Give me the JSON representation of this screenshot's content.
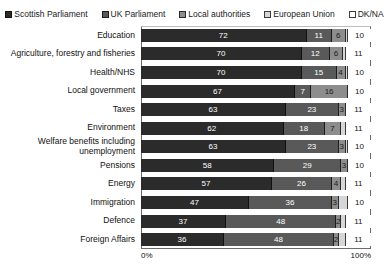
{
  "chart_data": {
    "type": "bar",
    "orientation": "horizontal",
    "stacked": true,
    "normalized_percent": true,
    "title": "",
    "subtitle": "",
    "xlabel": "",
    "ylabel": "",
    "xlim": [
      0,
      100
    ],
    "xticks": [
      "0%",
      "100%"
    ],
    "grid": false,
    "legend_position": "top",
    "categories": [
      "Education",
      "Agriculture, forestry and fisheries",
      "Health/NHS",
      "Local government",
      "Taxes",
      "Environment",
      "Welfare benefits including unemployment",
      "Pensions",
      "Energy",
      "Immigration",
      "Defence",
      "Foreign Affairs"
    ],
    "series": [
      {
        "name": "Scottish Parliament",
        "color": "#2b2b2b",
        "values": [
          72,
          70,
          70,
          67,
          63,
          62,
          63,
          58,
          57,
          47,
          37,
          36
        ]
      },
      {
        "name": "UK Parliament",
        "color": "#595959",
        "values": [
          11,
          12,
          15,
          7,
          23,
          18,
          23,
          29,
          26,
          36,
          48,
          48
        ]
      },
      {
        "name": "Local authorities",
        "color": "#8d8d8d",
        "values": [
          6,
          6,
          4,
          16,
          3,
          7,
          3,
          3,
          4,
          3,
          2,
          2
        ]
      },
      {
        "name": "European Union",
        "color": "#d6d6d6",
        "values": [
          1,
          1,
          1,
          0,
          0,
          2,
          1,
          0,
          2,
          4,
          2,
          3
        ]
      },
      {
        "name": "DK/NA",
        "color": "#ffffff",
        "values": [
          10,
          11,
          10,
          10,
          11,
          11,
          10,
          10,
          11,
          10,
          11,
          11
        ]
      }
    ],
    "data_labels": [
      {
        "category": "Education",
        "labels": [
          "72",
          "11",
          "6",
          "",
          "10"
        ]
      },
      {
        "category": "Agriculture, forestry and fisheries",
        "labels": [
          "70",
          "12",
          "6",
          "",
          "11"
        ]
      },
      {
        "category": "Health/NHS",
        "labels": [
          "70",
          "15",
          "4",
          "",
          "10"
        ]
      },
      {
        "category": "Local government",
        "labels": [
          "67",
          "7",
          "16",
          "",
          "10"
        ]
      },
      {
        "category": "Taxes",
        "labels": [
          "63",
          "23",
          "3",
          "",
          "11"
        ]
      },
      {
        "category": "Environment",
        "labels": [
          "62",
          "18",
          "7",
          "",
          "11"
        ]
      },
      {
        "category": "Welfare benefits including unemployment",
        "labels": [
          "63",
          "23",
          "3",
          "",
          "10"
        ]
      },
      {
        "category": "Pensions",
        "labels": [
          "58",
          "29",
          "3",
          "",
          "10"
        ]
      },
      {
        "category": "Energy",
        "labels": [
          "57",
          "26",
          "4",
          "",
          "11"
        ]
      },
      {
        "category": "Immigration",
        "labels": [
          "47",
          "36",
          "3",
          "",
          "10"
        ]
      },
      {
        "category": "Defence",
        "labels": [
          "37",
          "48",
          "2",
          "",
          "11"
        ]
      },
      {
        "category": "Foreign Affairs",
        "labels": [
          "36",
          "48",
          "2",
          "",
          "11"
        ]
      }
    ]
  },
  "legend": {
    "items": [
      {
        "label": "Scottish Parliament",
        "color": "#2b2b2b"
      },
      {
        "label": "UK Parliament",
        "color": "#595959"
      },
      {
        "label": "Local authorities",
        "color": "#8d8d8d"
      },
      {
        "label": "European Union",
        "color": "#d6d6d6"
      },
      {
        "label": "DK/NA",
        "color": "#ffffff"
      }
    ]
  },
  "axis": {
    "x_min_label": "0%",
    "x_max_label": "100%"
  }
}
